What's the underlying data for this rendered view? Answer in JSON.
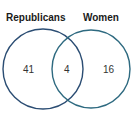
{
  "diagram": {
    "type": "venn",
    "sets": [
      {
        "name": "Republicans",
        "only": "41"
      },
      {
        "name": "Women",
        "only": "16"
      }
    ],
    "intersection": "4",
    "colors": {
      "left": "#2b4d73",
      "right": "#2e6a80"
    }
  }
}
